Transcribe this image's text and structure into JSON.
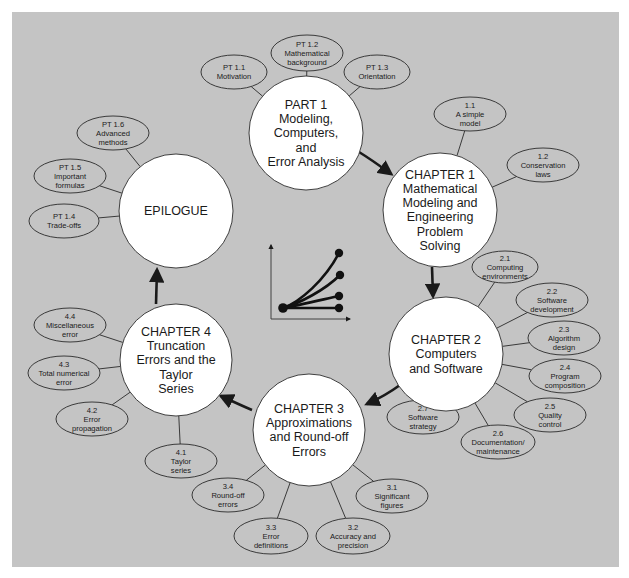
{
  "colors": {
    "background": "#ffffff",
    "panel": "#c4c4c4",
    "circle_fill": "#ffffff",
    "ellipse_fill": "#c4c4c4",
    "stroke": "#2a2a2a",
    "arrow": "#1a1a1a"
  },
  "panel": {
    "x": 12,
    "y": 12,
    "w": 607,
    "h": 555
  },
  "main_nodes": [
    {
      "id": "part1",
      "cx": 306,
      "cy": 133,
      "r": 57,
      "lines": [
        "PART 1",
        "Modeling,",
        "Computers,",
        "and",
        "Error Analysis"
      ]
    },
    {
      "id": "ch1",
      "cx": 440,
      "cy": 210,
      "r": 57,
      "lines": [
        "CHAPTER 1",
        "Mathematical",
        "Modeling and",
        "Engineering",
        "Problem",
        "Solving"
      ]
    },
    {
      "id": "ch2",
      "cx": 446,
      "cy": 354,
      "r": 57,
      "lines": [
        "CHAPTER 2",
        "Computers",
        "and Software"
      ]
    },
    {
      "id": "ch3",
      "cx": 309,
      "cy": 430,
      "r": 56,
      "lines": [
        "CHAPTER 3",
        "Approximations",
        "and Round-off",
        "Errors"
      ]
    },
    {
      "id": "ch4",
      "cx": 176,
      "cy": 360,
      "r": 56,
      "lines": [
        "CHAPTER 4",
        "Truncation",
        "Errors and the",
        "Taylor",
        "Series"
      ]
    },
    {
      "id": "epilogue",
      "cx": 176,
      "cy": 211,
      "r": 57,
      "lines": [
        "EPILOGUE"
      ]
    }
  ],
  "topic_nodes": [
    {
      "parent": "part1",
      "cx": 234,
      "cy": 72,
      "rx": 33,
      "ry": 17,
      "lines": [
        "PT 1.1",
        "Motivation"
      ]
    },
    {
      "parent": "part1",
      "cx": 307,
      "cy": 53,
      "rx": 36,
      "ry": 18,
      "lines": [
        "PT 1.2",
        "Mathematical",
        "background"
      ]
    },
    {
      "parent": "part1",
      "cx": 377,
      "cy": 72,
      "rx": 33,
      "ry": 17,
      "lines": [
        "PT 1.3",
        "Orientation"
      ]
    },
    {
      "parent": "ch1",
      "cx": 470,
      "cy": 114,
      "rx": 36,
      "ry": 17,
      "lines": [
        "1.1",
        "A simple",
        "model"
      ]
    },
    {
      "parent": "ch1",
      "cx": 543,
      "cy": 165,
      "rx": 36,
      "ry": 17,
      "lines": [
        "1.2",
        "Conservation",
        "laws"
      ]
    },
    {
      "parent": "ch2",
      "cx": 505,
      "cy": 267,
      "rx": 33,
      "ry": 16,
      "lines": [
        "2.1",
        "Computing",
        "environments"
      ]
    },
    {
      "parent": "ch2",
      "cx": 552,
      "cy": 300,
      "rx": 36,
      "ry": 17,
      "lines": [
        "2.2",
        "Software",
        "development"
      ]
    },
    {
      "parent": "ch2",
      "cx": 564,
      "cy": 338,
      "rx": 36,
      "ry": 17,
      "lines": [
        "2.3",
        "Algorithm",
        "design"
      ]
    },
    {
      "parent": "ch2",
      "cx": 565,
      "cy": 376,
      "rx": 36,
      "ry": 17,
      "lines": [
        "2.4",
        "Program",
        "composition"
      ]
    },
    {
      "parent": "ch2",
      "cx": 550,
      "cy": 415,
      "rx": 36,
      "ry": 17,
      "lines": [
        "2.5",
        "Quality",
        "control"
      ]
    },
    {
      "parent": "ch2",
      "cx": 498,
      "cy": 442,
      "rx": 37,
      "ry": 17,
      "lines": [
        "2.6",
        "Documentation/",
        "maintenance"
      ]
    },
    {
      "parent": "ch2",
      "cx": 423,
      "cy": 417,
      "rx": 36,
      "ry": 17,
      "lines": [
        "2.7",
        "Software",
        "strategy"
      ]
    },
    {
      "parent": "ch3",
      "cx": 392,
      "cy": 496,
      "rx": 36,
      "ry": 17,
      "lines": [
        "3.1",
        "Significant",
        "figures"
      ]
    },
    {
      "parent": "ch3",
      "cx": 353,
      "cy": 536,
      "rx": 37,
      "ry": 18,
      "lines": [
        "3.2",
        "Accuracy and",
        "precision"
      ]
    },
    {
      "parent": "ch3",
      "cx": 271,
      "cy": 536,
      "rx": 37,
      "ry": 18,
      "lines": [
        "3.3",
        "Error",
        "definitions"
      ]
    },
    {
      "parent": "ch3",
      "cx": 228,
      "cy": 495,
      "rx": 36,
      "ry": 17,
      "lines": [
        "3.4",
        "Round-off",
        "errors"
      ]
    },
    {
      "parent": "ch4",
      "cx": 181,
      "cy": 461,
      "rx": 36,
      "ry": 17,
      "lines": [
        "4.1",
        "Taylor",
        "series"
      ]
    },
    {
      "parent": "ch4",
      "cx": 92,
      "cy": 419,
      "rx": 36,
      "ry": 17,
      "lines": [
        "4.2",
        "Error",
        "propagation"
      ]
    },
    {
      "parent": "ch4",
      "cx": 64,
      "cy": 373,
      "rx": 36,
      "ry": 17,
      "lines": [
        "4.3",
        "Total numerical",
        "error"
      ]
    },
    {
      "parent": "ch4",
      "cx": 70,
      "cy": 325,
      "rx": 36,
      "ry": 17,
      "lines": [
        "4.4",
        "Miscellaneous",
        "error"
      ]
    },
    {
      "parent": "epilogue",
      "cx": 64,
      "cy": 221,
      "rx": 35,
      "ry": 17,
      "lines": [
        "PT 1.4",
        "Trade-offs"
      ]
    },
    {
      "parent": "epilogue",
      "cx": 70,
      "cy": 176,
      "rx": 36,
      "ry": 17,
      "lines": [
        "PT 1.5",
        "Important",
        "formulas"
      ]
    },
    {
      "parent": "epilogue",
      "cx": 113,
      "cy": 133,
      "rx": 36,
      "ry": 17,
      "lines": [
        "PT 1.6",
        "Advanced",
        "methods"
      ]
    }
  ],
  "flow_arrows": [
    {
      "from": "part1",
      "to": "ch1",
      "path": "M 359 152 Q 372 160 391 174"
    },
    {
      "from": "ch1",
      "to": "ch2",
      "path": "M 432 267 L 433 296"
    },
    {
      "from": "ch2",
      "to": "ch3",
      "path": "M 400 385 Q 385 396 367 404"
    },
    {
      "from": "ch3",
      "to": "ch4",
      "path": "M 252 410 Q 238 404 221 396"
    },
    {
      "from": "ch4",
      "to": "epilogue",
      "path": "M 156 304 L 157 270"
    }
  ],
  "center_icon": {
    "name": "curves-chart-icon",
    "axis": {
      "x0": 271,
      "y0": 319,
      "xTop": 245,
      "xRight": 350
    },
    "origin": {
      "x": 283,
      "y": 308
    },
    "end_points": [
      {
        "x": 339,
        "y": 253,
        "c1x": 300,
        "c1y": 302,
        "c2x": 325,
        "c2y": 280
      },
      {
        "x": 340,
        "y": 275,
        "c1x": 300,
        "c1y": 303,
        "c2x": 325,
        "c2y": 290
      },
      {
        "x": 339,
        "y": 296,
        "c1x": 300,
        "c1y": 305,
        "c2x": 325,
        "c2y": 299
      },
      {
        "x": 339,
        "y": 308,
        "c1x": 300,
        "c1y": 308,
        "c2x": 320,
        "c2y": 308
      }
    ]
  }
}
